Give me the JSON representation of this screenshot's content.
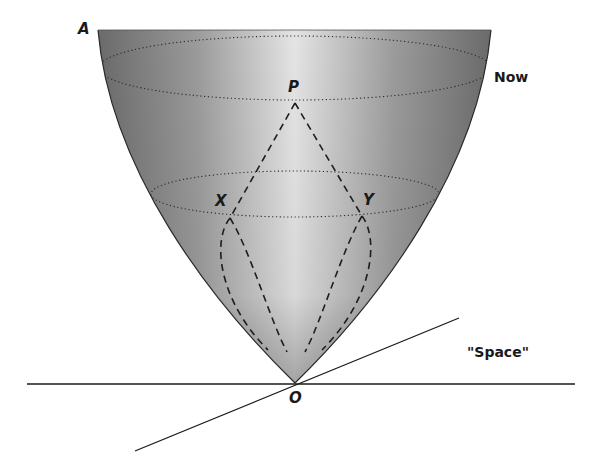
{
  "diagram": {
    "type": "spacetime-paraboloid",
    "colors": {
      "background": "#ffffff",
      "shade_dark": "#6e6e6e",
      "shade_light": "#e2e2e2",
      "line": "#1a1a1a"
    },
    "labels": {
      "A": "A",
      "now": "Now",
      "P": "P",
      "X": "X",
      "Y": "Y",
      "O": "O",
      "space": "\"Space\""
    },
    "points": {
      "A": [
        98,
        30
      ],
      "P": [
        295,
        103
      ],
      "X": [
        230,
        218
      ],
      "Y": [
        362,
        216
      ],
      "O": [
        295,
        383
      ]
    },
    "lines": {
      "space_horizontal": [
        [
          27,
          384
        ],
        [
          575,
          384
        ]
      ],
      "space_oblique": [
        [
          135,
          451
        ],
        [
          459,
          318
        ]
      ]
    }
  }
}
